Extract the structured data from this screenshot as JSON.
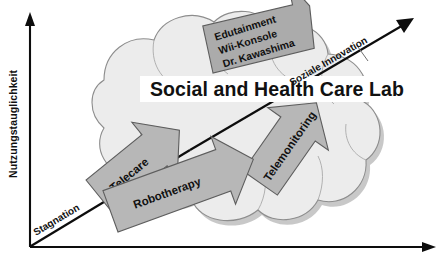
{
  "figure": {
    "title": "Social and Health Care Lab",
    "axes": {
      "y_label": "Nutzungstauglichkeit",
      "x_label": "",
      "diagonal_up_label": "Soziale Innovation",
      "diagonal_low_label": "Stagnation"
    },
    "cloud": {
      "name": "innovation-cloud"
    },
    "blocks": [
      {
        "id": "edutainment",
        "lines": [
          "Edutainment",
          "Wii-Konsole",
          "Dr. Kawashima"
        ],
        "shape": "callout"
      },
      {
        "id": "telecare",
        "lines": [
          "Telecare"
        ],
        "shape": "arrow"
      },
      {
        "id": "telemonitoring",
        "lines": [
          "Telemonitoring"
        ],
        "shape": "arrow"
      },
      {
        "id": "robotherapy",
        "lines": [
          "Robotherapy"
        ],
        "shape": "arrow"
      }
    ],
    "colors": {
      "cloud_fill": "#ececec",
      "cloud_stroke": "#8d8d8d",
      "block_fill": "#b7b7b7",
      "block_stroke": "#5d5d5d",
      "axis": "#0d0d0d",
      "banner": "#ffffff"
    }
  }
}
